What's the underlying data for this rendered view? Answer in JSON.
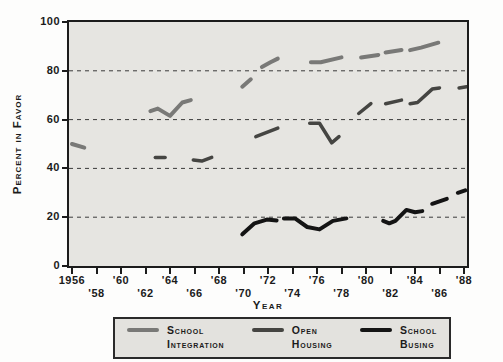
{
  "chart_data": {
    "type": "line",
    "title": "",
    "xlabel": "Year",
    "ylabel": "Percent in Favor",
    "x_range": [
      1956,
      1988
    ],
    "y_range": [
      0,
      100
    ],
    "grid_on": true,
    "grid_values": [
      20,
      40,
      60,
      80
    ],
    "grid_color": "#3a3a3a",
    "y_ticks": [
      {
        "value": 0,
        "label": "0"
      },
      {
        "value": 20,
        "label": "20"
      },
      {
        "value": 40,
        "label": "40"
      },
      {
        "value": 60,
        "label": "60"
      },
      {
        "value": 80,
        "label": "80"
      },
      {
        "value": 100,
        "label": "100"
      }
    ],
    "x_ticks": [
      {
        "year": 1956,
        "label": "1956",
        "row": 1
      },
      {
        "year": 1958,
        "label": "'58",
        "row": 2
      },
      {
        "year": 1960,
        "label": "'60",
        "row": 1
      },
      {
        "year": 1962,
        "label": "'62",
        "row": 2
      },
      {
        "year": 1964,
        "label": "'64",
        "row": 1
      },
      {
        "year": 1966,
        "label": "'66",
        "row": 2
      },
      {
        "year": 1968,
        "label": "'68",
        "row": 1
      },
      {
        "year": 1970,
        "label": "'70",
        "row": 2
      },
      {
        "year": 1972,
        "label": "'72",
        "row": 1
      },
      {
        "year": 1974,
        "label": "'74",
        "row": 2
      },
      {
        "year": 1976,
        "label": "'76",
        "row": 1
      },
      {
        "year": 1978,
        "label": "'78",
        "row": 2
      },
      {
        "year": 1980,
        "label": "'80",
        "row": 1
      },
      {
        "year": 1982,
        "label": "'82",
        "row": 2
      },
      {
        "year": 1984,
        "label": "'84",
        "row": 1
      },
      {
        "year": 1986,
        "label": "'86",
        "row": 2
      },
      {
        "year": 1988,
        "label": "'88",
        "row": 1
      }
    ],
    "series": [
      {
        "name": "School Integration",
        "color": "#797977",
        "width": 4,
        "segments": [
          [
            [
              1956,
              50
            ],
            [
              1957,
              48.5
            ]
          ],
          [
            [
              1962.4,
              63.5
            ],
            [
              1963,
              64.5
            ],
            [
              1964,
              61.5
            ],
            [
              1965,
              67
            ],
            [
              1965.7,
              68
            ]
          ],
          [
            [
              1969.9,
              73.5
            ],
            [
              1970.6,
              76.5
            ]
          ],
          [
            [
              1971.5,
              81.5
            ],
            [
              1972.2,
              83.5
            ],
            [
              1972.8,
              85
            ]
          ],
          [
            [
              1975.5,
              83.5
            ],
            [
              1976.3,
              83.5
            ],
            [
              1978,
              85.5
            ]
          ],
          [
            [
              1979.6,
              85.5
            ],
            [
              1981,
              86.5
            ]
          ],
          [
            [
              1981.6,
              87.5
            ],
            [
              1982.9,
              88.5
            ]
          ],
          [
            [
              1983.6,
              88.5
            ],
            [
              1984.5,
              89.5
            ],
            [
              1985.9,
              91.5
            ]
          ]
        ]
      },
      {
        "name": "Open Housing",
        "color": "#454542",
        "width": 3.5,
        "segments": [
          [
            [
              1962.8,
              44.5
            ],
            [
              1963.6,
              44.5
            ]
          ],
          [
            [
              1965.9,
              43.5
            ],
            [
              1966.6,
              43
            ],
            [
              1967.4,
              44.5
            ]
          ],
          [
            [
              1971,
              53
            ],
            [
              1972.8,
              56.5
            ]
          ],
          [
            [
              1975.4,
              58.5
            ],
            [
              1976.2,
              58.5
            ],
            [
              1977.2,
              50.5
            ],
            [
              1977.8,
              53
            ]
          ],
          [
            [
              1979.4,
              62.5
            ],
            [
              1980.4,
              66.5
            ]
          ],
          [
            [
              1981.6,
              66.5
            ],
            [
              1982.9,
              68
            ]
          ],
          [
            [
              1983.6,
              66.5
            ],
            [
              1984.2,
              67
            ],
            [
              1985.4,
              72.5
            ],
            [
              1986,
              73
            ]
          ],
          [
            [
              1987.6,
              73
            ],
            [
              1988.2,
              73.5
            ]
          ]
        ]
      },
      {
        "name": "School Busing",
        "color": "#141414",
        "width": 4,
        "segments": [
          [
            [
              1969.9,
              13
            ],
            [
              1970.9,
              17.5
            ],
            [
              1971.9,
              19
            ],
            [
              1972.7,
              18.7
            ]
          ],
          [
            [
              1973.3,
              19.5
            ],
            [
              1974.2,
              19.5
            ],
            [
              1975.2,
              16
            ],
            [
              1976.2,
              15
            ],
            [
              1977.3,
              18.5
            ],
            [
              1978.4,
              19.5
            ]
          ],
          [
            [
              1981.4,
              18.5
            ],
            [
              1981.9,
              17.5
            ],
            [
              1982.4,
              18.5
            ],
            [
              1983.3,
              23
            ],
            [
              1984,
              22
            ],
            [
              1984.6,
              22.5
            ]
          ],
          [
            [
              1985.4,
              25.5
            ],
            [
              1986.6,
              27.5
            ]
          ],
          [
            [
              1987.5,
              30
            ],
            [
              1988.1,
              31
            ]
          ]
        ]
      }
    ]
  },
  "axes": {
    "y_title": "Percent in Favor",
    "x_title": "Year"
  },
  "legend": {
    "items": [
      {
        "name": "School Integration",
        "line1": "School",
        "line2": "Integration",
        "color": "#797977"
      },
      {
        "name": "Open Housing",
        "line1": "Open",
        "line2": "Housing",
        "color": "#454542"
      },
      {
        "name": "School Busing",
        "line1": "School",
        "line2": "Busing",
        "color": "#141414"
      }
    ]
  },
  "colors": {
    "plot_background": "#e6e5e1",
    "page_background": "#fdfdfc",
    "axis": "#1c1c1c",
    "gridline": "#3a3a3a"
  }
}
